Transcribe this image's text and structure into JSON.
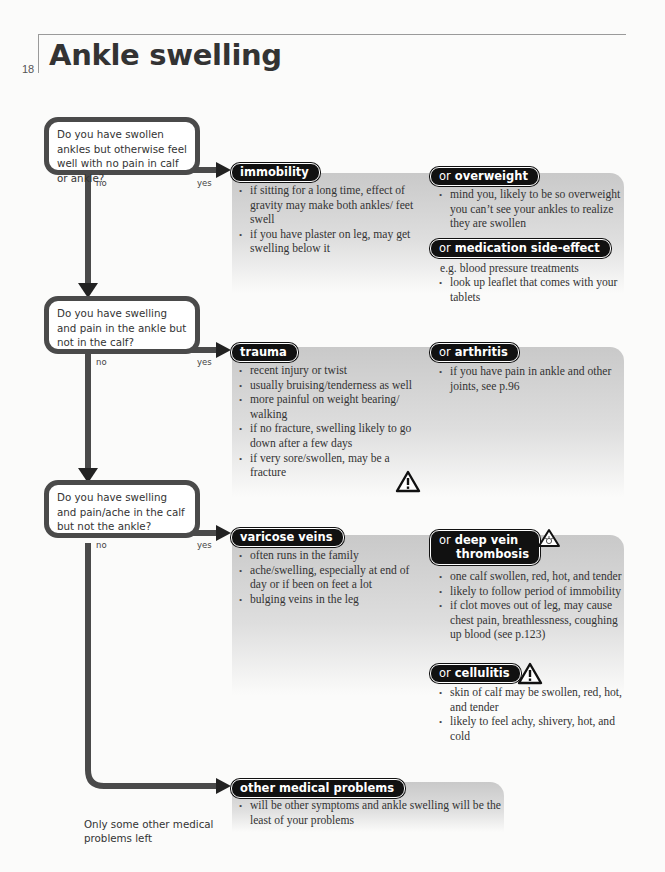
{
  "page": {
    "number": "18",
    "title": "Ankle swelling"
  },
  "branch_labels": {
    "no": "no",
    "yes": "yes"
  },
  "questions": [
    {
      "text": "Do you have swollen ankles but otherwise feel well with no pain in calf or ankle?",
      "yes": {
        "label": "immobility",
        "items": [
          "if sitting for a long time, effect of gravity may make both ankles/ feet swell",
          "if you have plaster on leg, may get swelling below it"
        ]
      },
      "alternatives": [
        {
          "prefix": "or",
          "label": "overweight",
          "items": [
            "mind you, likely to be so overweight you can’t see your ankles to realize they are swollen"
          ]
        },
        {
          "prefix": "or",
          "label": "medication side-effect",
          "intro": "e.g. blood pressure treatments",
          "items": [
            "look up leaflet that comes with your tablets"
          ]
        }
      ]
    },
    {
      "text": "Do you have swelling and pain in the ankle but not in the calf?",
      "yes": {
        "label": "trauma",
        "items": [
          "recent injury or twist",
          "usually bruising/tenderness as well",
          "more painful on weight bearing/ walking",
          "if no fracture, swelling likely to go down after a few days",
          "if very sore/swollen, may be a fracture"
        ],
        "warning": "warning-triangle"
      },
      "alternatives": [
        {
          "prefix": "or",
          "label": "arthritis",
          "items": [
            "if you have pain in ankle and other joints, see p.96"
          ]
        }
      ]
    },
    {
      "text": "Do you have swelling and pain/ache in the calf but not the ankle?",
      "yes": {
        "label": "varicose veins",
        "items": [
          "often runs in the family",
          "ache/swelling, especially at end of day or if been on feet a lot",
          "bulging veins in the leg"
        ]
      },
      "alternatives": [
        {
          "prefix": "or",
          "label_line1": "deep vein",
          "label_line2": "thrombosis",
          "warning": "emergency-warning-triangle",
          "items": [
            "one calf swollen, red, hot, and tender",
            "likely to follow period of immobility",
            "if clot moves out of leg, may cause chest pain, breathlessness, coughing up blood (see p.123)"
          ]
        },
        {
          "prefix": "or",
          "label": "cellulitis",
          "warning": "warning-triangle",
          "items": [
            "skin of calf may be swollen, red, hot, and tender",
            "likely to feel achy, shivery, hot, and cold"
          ]
        }
      ]
    }
  ],
  "final": {
    "note": "Only some other medical problems left",
    "label": "other medical problems",
    "items": [
      "will be other symptoms and ankle swelling will be the least of your problems"
    ]
  },
  "colors": {
    "pill_bg": "#111111",
    "line": "#4a4a4a",
    "panel": "#cfcfcf"
  }
}
